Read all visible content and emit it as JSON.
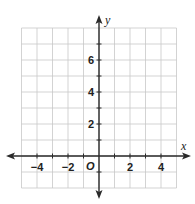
{
  "chart_data": {
    "type": "scatter",
    "title": "",
    "xlabel": "x",
    "ylabel": "y",
    "origin_label": "O",
    "xlim": [
      -5,
      5
    ],
    "ylim": [
      -2,
      8
    ],
    "grid": true,
    "grid_step": 1,
    "x_ticks": [
      -4,
      -2,
      2,
      4
    ],
    "x_tick_labels": [
      "−4",
      "−2",
      "2",
      "4"
    ],
    "y_ticks": [
      2,
      4,
      6
    ],
    "y_tick_labels": [
      "2",
      "4",
      "6"
    ],
    "series": [],
    "colors": {
      "grid": "#c8c8c8",
      "axis": "#2a2a2a",
      "text": "#222222"
    }
  }
}
